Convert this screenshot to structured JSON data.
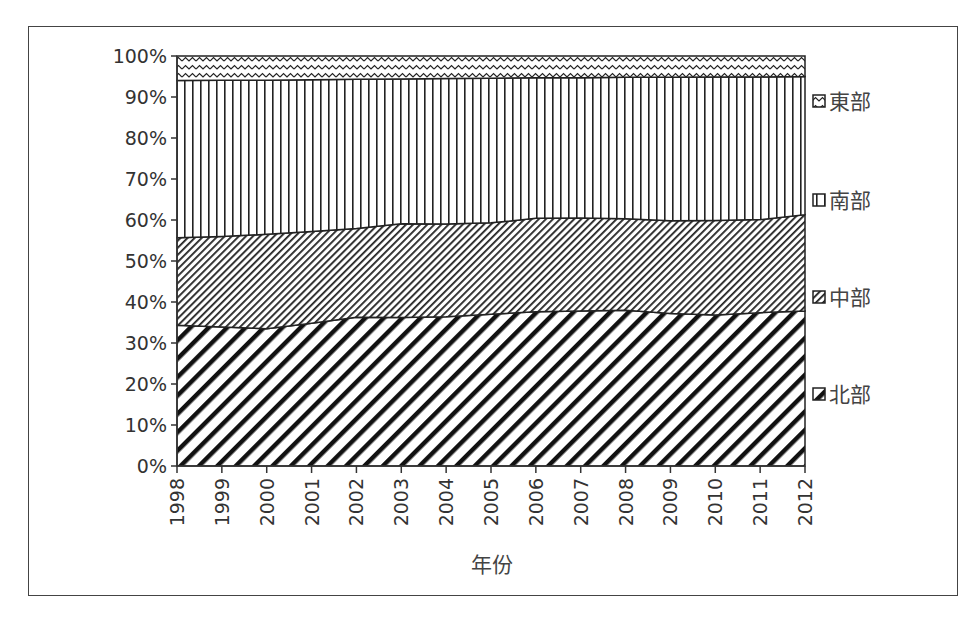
{
  "chart_data": {
    "type": "area",
    "stacked": "percent",
    "title": "",
    "xlabel": "年份",
    "ylabel": "",
    "ylim": [
      0,
      100
    ],
    "yticks": [
      "0%",
      "10%",
      "20%",
      "30%",
      "40%",
      "50%",
      "60%",
      "70%",
      "80%",
      "90%",
      "100%"
    ],
    "categories": [
      "1998",
      "1999",
      "2000",
      "2001",
      "2002",
      "2003",
      "2004",
      "2005",
      "2006",
      "2007",
      "2008",
      "2009",
      "2010",
      "2011",
      "2012"
    ],
    "series": [
      {
        "name": "北部",
        "pattern": "thick-diagonal",
        "values": [
          34.3,
          33.9,
          33.5,
          34.8,
          36.3,
          36.2,
          36.4,
          37.0,
          37.6,
          37.8,
          38.0,
          37.2,
          36.8,
          37.4,
          37.8
        ]
      },
      {
        "name": "中部",
        "pattern": "fine-diagonal",
        "values": [
          21.4,
          22.1,
          23.0,
          22.4,
          21.6,
          22.9,
          22.6,
          22.3,
          22.8,
          22.7,
          22.3,
          22.6,
          23.1,
          22.7,
          23.5
        ]
      },
      {
        "name": "南部",
        "pattern": "vertical-lines",
        "values": [
          38.3,
          38.1,
          37.6,
          37.0,
          36.4,
          35.3,
          35.5,
          35.3,
          34.3,
          34.2,
          34.5,
          35.0,
          35.0,
          34.8,
          33.7
        ]
      },
      {
        "name": "東部",
        "pattern": "wave",
        "values": [
          6.0,
          5.9,
          5.9,
          5.8,
          5.7,
          5.6,
          5.5,
          5.4,
          5.3,
          5.3,
          5.2,
          5.2,
          5.1,
          5.1,
          5.0
        ]
      }
    ],
    "legend": {
      "position": "right",
      "order": [
        "東部",
        "南部",
        "中部",
        "北部"
      ]
    },
    "grid": false
  },
  "legend_labels": [
    "東部",
    "南部",
    "中部",
    "北部"
  ],
  "axis": {
    "x_title": "年份"
  }
}
